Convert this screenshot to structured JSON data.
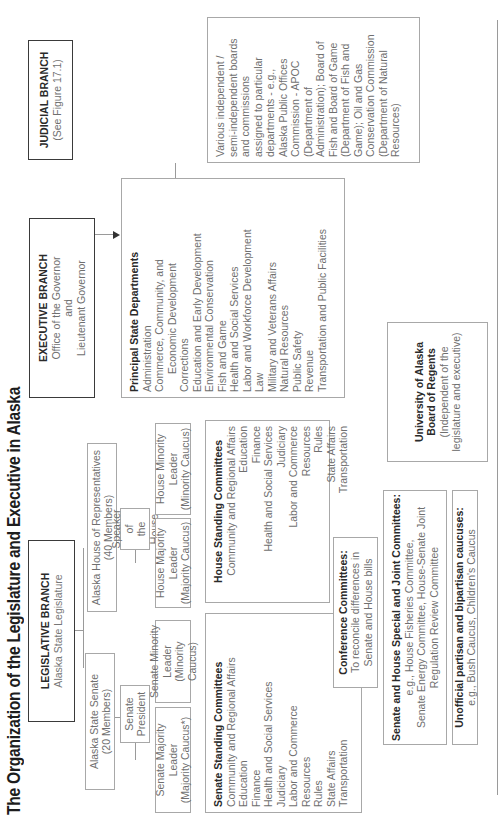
{
  "title": "The Organization of the Legislature and Executive in Alaska",
  "legislative": {
    "heading": "LEGISLATIVE BRANCH",
    "sub": "Alaska State Legislature",
    "senate": {
      "line1": "Alaska State Senate",
      "line2": "(20 Members)"
    },
    "house": {
      "line1": "Alaska House of Representatives",
      "line2": "(40 Members)"
    },
    "senate_president": {
      "line1": "Senate",
      "line2": "President"
    },
    "speaker": {
      "line1": "Speaker of",
      "line2": "the House"
    },
    "senate_majority": {
      "line1": "Senate Majority",
      "line2": "Leader",
      "line3": "(Majority Caucus*)"
    },
    "senate_minority": {
      "line1": "Senate Minority",
      "line2": "Leader",
      "line3": "(Minority Caucus)"
    },
    "house_majority": {
      "line1": "House Majority",
      "line2": "Leader",
      "line3": "(Majority Caucus)"
    },
    "house_minority": {
      "line1": "House Minority",
      "line2": "Leader",
      "line3": "(Minority Caucus)"
    },
    "senate_standing": {
      "heading": "Senate Standing Committees",
      "items": [
        "Community and Regional Affairs",
        "Education",
        "Finance",
        "Health and Social Services",
        "Judiciary",
        "Labor and Commerce",
        "Resources",
        "Rules",
        "State Affairs",
        "Transportation"
      ]
    },
    "house_standing": {
      "heading": "House Standing Committees",
      "items": [
        "Community and Regional Affairs",
        "Education",
        "Finance",
        "Health and Social Services",
        "Judiciary",
        "Labor and Commerce",
        "Resources",
        "Rules",
        "State Affairs",
        "Transportation"
      ]
    },
    "conference": {
      "heading": "Conference Committees:",
      "line1": "To reconcile differences in",
      "line2": "Senate and House bills"
    },
    "special_joint": {
      "heading": "Senate and House Special and Joint Committees:",
      "line1": "e.g., House Fisheries Committee,",
      "line2": "Senate Energy Committee, House-Senate Joint",
      "line3": "Regulation Review Committee"
    },
    "unofficial": {
      "heading": "Unofficial partisan and bipartisan caucuses:",
      "line1": "e.g., Bush Caucus, Children's Caucus"
    }
  },
  "executive": {
    "heading": "EXECUTIVE BRANCH",
    "line1": "Office of the Governor",
    "line2": "and",
    "line3": "Lieutenant Governor",
    "departments": {
      "heading": "Principal State Departments",
      "items": [
        "Administration",
        "Commerce, Community, and",
        "Economic Development",
        "Corrections",
        "Education and Early Development",
        "Environmental Conservation",
        "Fish and Game",
        "Health and Social Services",
        "Labor and Workforce Development",
        "Law",
        "Military and Veterans Affairs",
        "Natural Resources",
        "Public Safety",
        "Revenue",
        "Transportation and Public Facilities"
      ]
    },
    "independent": {
      "lines": [
        "Various independent /",
        "semi-independent boards",
        "and commissions",
        "assigned to particular",
        "departments - e.g.,",
        "Alaska Public Offices",
        "Commission - APOC",
        "(Department of",
        "Administration); Board of",
        "Fish and Board of Game",
        "(Department of Fish and",
        "Game); Oil and Gas",
        "Conservation Commission",
        "(Department of Natural",
        "Resources)"
      ]
    }
  },
  "university": {
    "line1": "University of Alaska",
    "line2": "Board of Regents",
    "line3": "(Independent of the",
    "line4": "legislature and executive)"
  },
  "judicial": {
    "heading": "JUDICIAL BRANCH",
    "sub": "(See Figure 17.1)"
  }
}
